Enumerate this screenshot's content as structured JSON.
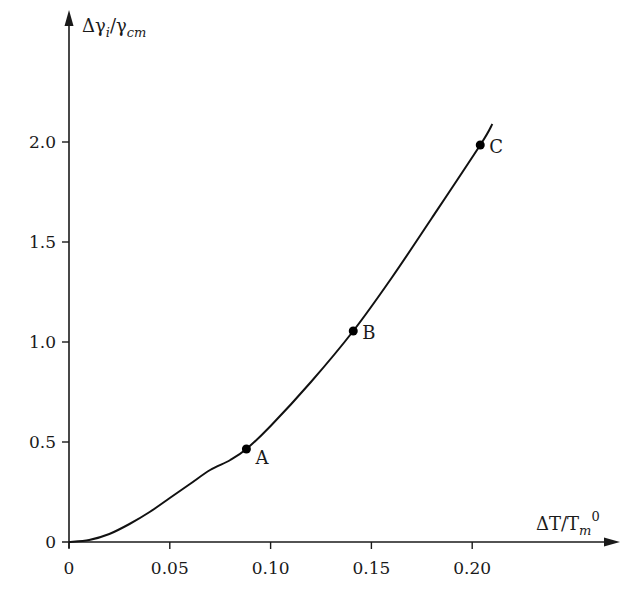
{
  "chart_data": {
    "type": "line",
    "title": "",
    "xlabel": "ΔT/Tm⁰",
    "ylabel": "Δγi/γcm",
    "xlim": [
      0,
      0.22
    ],
    "ylim": [
      0,
      2.2
    ],
    "x_ticks": [
      "0",
      "0.05",
      "0.10",
      "0.15",
      "0.20"
    ],
    "y_ticks": [
      "0",
      "0.5",
      "1.0",
      "1.5",
      "2.0"
    ],
    "grid": false,
    "legend": null,
    "series": [
      {
        "name": "curve",
        "x": [
          0,
          0.01,
          0.02,
          0.03,
          0.04,
          0.05,
          0.06,
          0.07,
          0.08,
          0.088,
          0.1,
          0.12,
          0.141,
          0.16,
          0.18,
          0.204,
          0.21
        ],
        "y": [
          0,
          0.01,
          0.04,
          0.09,
          0.15,
          0.22,
          0.29,
          0.36,
          0.41,
          0.465,
          0.58,
          0.8,
          1.055,
          1.32,
          1.62,
          1.985,
          2.09
        ]
      }
    ],
    "points": [
      {
        "label": "A",
        "x": 0.088,
        "y": 0.465
      },
      {
        "label": "B",
        "x": 0.141,
        "y": 1.055
      },
      {
        "label": "C",
        "x": 0.204,
        "y": 1.985
      }
    ]
  },
  "axes": {
    "x_label_main": "ΔT/T",
    "x_label_sub": "m",
    "x_label_sup": "0",
    "y_label_main": "Δγ",
    "y_label_sub1": "i",
    "y_label_mid": "/γ",
    "y_label_sub2": "cm"
  }
}
